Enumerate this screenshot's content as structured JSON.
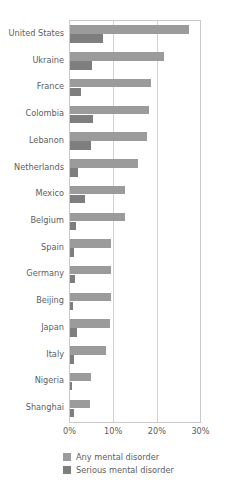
{
  "chart_data": {
    "type": "bar",
    "orientation": "horizontal",
    "title": "",
    "subtitle": "",
    "xlabel": "",
    "ylabel": "",
    "xlim": [
      0,
      30
    ],
    "xticks": [
      "0%",
      "10%",
      "20%",
      "30%"
    ],
    "xtick_values": [
      0,
      10,
      20,
      30
    ],
    "grid": true,
    "legend_position": "bottom",
    "categories": [
      "United States",
      "Ukraine",
      "France",
      "Colombia",
      "Lebanon",
      "Netherlands",
      "Mexico",
      "Belgium",
      "Spain",
      "Germany",
      "Beijing",
      "Japan",
      "Italy",
      "Nigeria",
      "Shanghai"
    ],
    "series": [
      {
        "name": "Any mental disorder",
        "color": "#9b9b9b",
        "values": [
          27.3,
          21.6,
          18.6,
          18.2,
          17.7,
          15.5,
          12.7,
          12.5,
          9.5,
          9.3,
          9.5,
          9.2,
          8.2,
          4.7,
          4.5
        ]
      },
      {
        "name": "Serious mental disorder",
        "color": "#7e7e7e",
        "values": [
          7.5,
          5.0,
          2.5,
          5.2,
          4.8,
          1.8,
          3.4,
          1.4,
          1.0,
          1.2,
          0.8,
          1.5,
          1.0,
          0.4,
          1.0
        ]
      }
    ]
  },
  "legend": {
    "items": [
      {
        "label": "Any mental disorder",
        "color": "#9b9b9b"
      },
      {
        "label": "Serious mental disorder",
        "color": "#7e7e7e"
      }
    ]
  },
  "colors": {
    "any": "#9b9b9b",
    "serious": "#7e7e7e",
    "grid": "#d2d2d2",
    "axis_text": "#5d5d5f",
    "background": "#ffffff"
  }
}
